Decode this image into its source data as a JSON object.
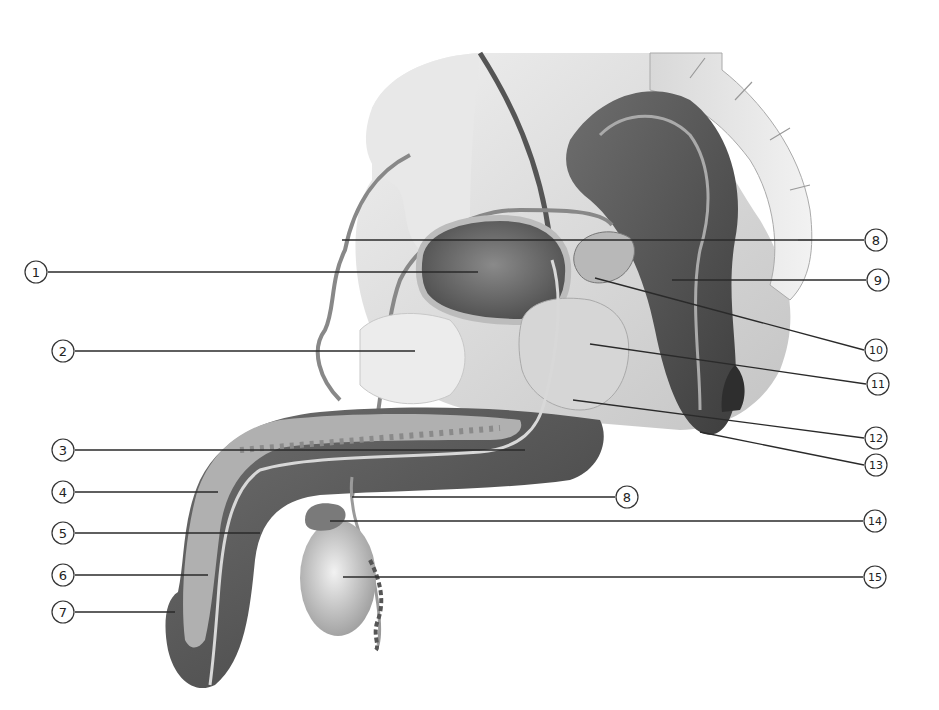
{
  "diagram": {
    "style": "grayscale anatomical illustration",
    "colors": {
      "background": "#ffffff",
      "leader_line": "#2a2a2a",
      "callout_outline": "#333333",
      "dark_tissue": "#5a5a5a",
      "mid_tissue": "#8c8c8c",
      "light_tissue": "#c8c8c8",
      "pale_tissue": "#e2e2e2"
    },
    "callouts": [
      {
        "id": "1",
        "label": "1",
        "glyph": "①",
        "side": "left",
        "cx": 36,
        "cy": 272,
        "line": [
          48,
          272,
          478,
          272
        ]
      },
      {
        "id": "2",
        "label": "2",
        "glyph": "②",
        "side": "left",
        "cx": 63,
        "cy": 351,
        "line": [
          75,
          351,
          415,
          351
        ]
      },
      {
        "id": "3",
        "label": "3",
        "glyph": "③",
        "side": "left",
        "cx": 63,
        "cy": 450,
        "line": [
          75,
          450,
          525,
          450
        ]
      },
      {
        "id": "4",
        "label": "4",
        "glyph": "④",
        "side": "left",
        "cx": 63,
        "cy": 492,
        "line": [
          75,
          492,
          218,
          492
        ]
      },
      {
        "id": "5",
        "label": "5",
        "glyph": "⑤",
        "side": "left",
        "cx": 63,
        "cy": 533,
        "line": [
          75,
          533,
          260,
          533
        ]
      },
      {
        "id": "6",
        "label": "6",
        "glyph": "⑥",
        "side": "left",
        "cx": 63,
        "cy": 575,
        "line": [
          75,
          575,
          208,
          575
        ]
      },
      {
        "id": "7",
        "label": "7",
        "glyph": "⑦",
        "side": "left",
        "cx": 63,
        "cy": 612,
        "line": [
          75,
          612,
          175,
          612
        ]
      },
      {
        "id": "8a",
        "label": "8",
        "glyph": "⑧",
        "side": "right",
        "cx": 876,
        "cy": 240,
        "line": [
          342,
          240,
          864,
          240
        ]
      },
      {
        "id": "9",
        "label": "9",
        "glyph": "⑨",
        "side": "right",
        "cx": 878,
        "cy": 280,
        "line": [
          672,
          280,
          866,
          280
        ]
      },
      {
        "id": "10",
        "label": "10",
        "glyph": "⑩",
        "side": "right",
        "cx": 876,
        "cy": 350,
        "line": [
          595,
          278,
          864,
          350
        ]
      },
      {
        "id": "11",
        "label": "11",
        "glyph": "⑪",
        "side": "right",
        "cx": 878,
        "cy": 384,
        "line": [
          590,
          344,
          866,
          384
        ]
      },
      {
        "id": "12",
        "label": "12",
        "glyph": "⑫",
        "side": "right",
        "cx": 876,
        "cy": 438,
        "line": [
          573,
          400,
          864,
          438
        ]
      },
      {
        "id": "13",
        "label": "13",
        "glyph": "⑬",
        "side": "right",
        "cx": 876,
        "cy": 465,
        "line": [
          700,
          432,
          864,
          465
        ]
      },
      {
        "id": "8b",
        "label": "8",
        "glyph": "⑧",
        "side": "right",
        "cx": 627,
        "cy": 497,
        "line": [
          352,
          497,
          615,
          497
        ]
      },
      {
        "id": "14",
        "label": "14",
        "glyph": "⑭",
        "side": "right",
        "cx": 875,
        "cy": 521,
        "line": [
          330,
          521,
          863,
          521
        ]
      },
      {
        "id": "15",
        "label": "15",
        "glyph": "⑮",
        "side": "right",
        "cx": 875,
        "cy": 577,
        "line": [
          343,
          577,
          863,
          577
        ]
      }
    ]
  }
}
